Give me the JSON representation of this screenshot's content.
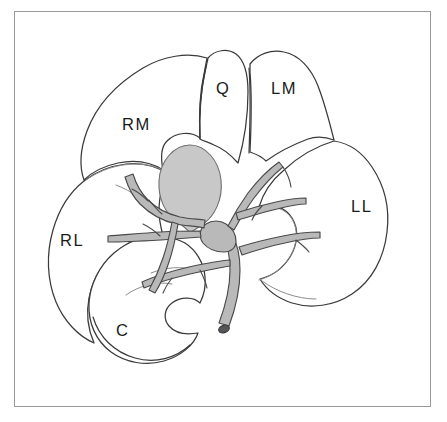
{
  "figure": {
    "kind": "anatomical-line-diagram",
    "background_color": "#ffffff",
    "frame_color": "#9a9a9a",
    "outline_color": "#3a3a3a",
    "gallbladder_fill": "#c8c8c8",
    "gallbladder_stroke": "#6f6f6f",
    "vessel_fill": "#b9b9b9",
    "vessel_stroke": "#4a4a4a",
    "duct_lumen_fill": "#55555a"
  },
  "labels": {
    "right_medial": "RM",
    "quadrate": "Q",
    "left_medial": "LM",
    "left_lateral": "LL",
    "right_lateral": "RL",
    "caudate": "C"
  },
  "label_positions": {
    "right_medial": {
      "x": 122,
      "y": 115
    },
    "quadrate": {
      "x": 216,
      "y": 79
    },
    "left_medial": {
      "x": 271,
      "y": 79
    },
    "left_lateral": {
      "x": 351,
      "y": 197
    },
    "right_lateral": {
      "x": 60,
      "y": 231
    },
    "caudate": {
      "x": 116,
      "y": 321
    }
  },
  "structures": [
    {
      "name": "gallbladder",
      "shape": "shaded-ellipse",
      "fill": "#c8c8c8"
    },
    {
      "name": "portal-vein-trunk",
      "shape": "tapered-tube",
      "fill": "#b9b9b9"
    },
    {
      "name": "bile-duct-stump",
      "shape": "cut-end-oval",
      "fill": "#55555a"
    }
  ]
}
